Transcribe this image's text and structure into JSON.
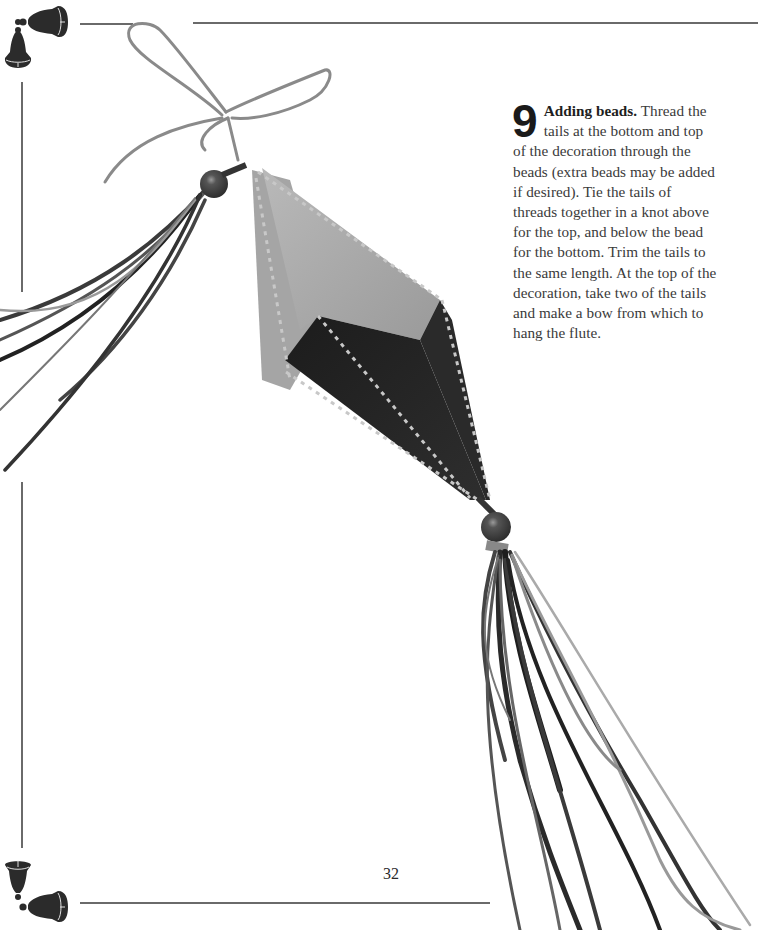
{
  "page": {
    "background": "#ffffff",
    "rule_color": "#6a6a6a",
    "page_number": "32"
  },
  "instruction": {
    "step_number": "9",
    "title": "Adding beads.",
    "body": " Thread the tails at the bottom and top of the decoration through the beads (extra beads may be added if desired). Tie the tails of threads together in a knot above for the top, and below the bead for the bottom. Trim the tails to the same length. At the top of the decoration, take two of the tails and make a bow from which to hang the flute."
  },
  "decorations": {
    "top_corner": "bell-pair-icon",
    "bottom_corner": "bell-pair-icon"
  },
  "photo": {
    "subject": "fabric diamond ornament with stitched edges, beads and ribbon tassels"
  }
}
